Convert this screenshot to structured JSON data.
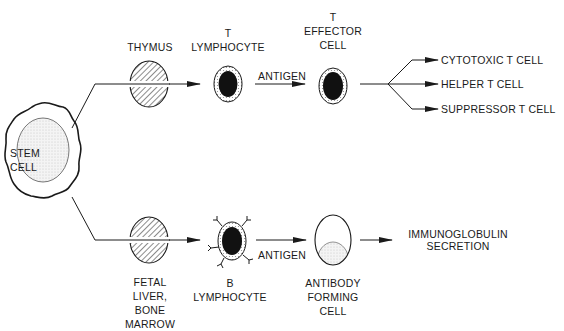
{
  "diagram": {
    "type": "flow",
    "colors": {
      "ink": "#1a1a1a",
      "background": "#ffffff",
      "stipple": "#d9d9d9"
    },
    "nodes": {
      "stem_cell": {
        "line1": "STEM",
        "line2": "CELL"
      },
      "thymus": {
        "label": "THYMUS"
      },
      "t_lymphocyte": {
        "line1": "T",
        "line2": "LYMPHOCYTE"
      },
      "t_effector": {
        "line1": "T",
        "line2": "EFFECTOR",
        "line3": "CELL"
      },
      "fetal_liver": {
        "line1": "FETAL",
        "line2": "LIVER,",
        "line3": "BONE",
        "line4": "MARROW"
      },
      "b_lymphocyte": {
        "line1": "B",
        "line2": "LYMPHOCYTE"
      },
      "antibody_cell": {
        "line1": "ANTIBODY",
        "line2": "FORMING",
        "line3": "CELL"
      }
    },
    "edges": {
      "antigen_upper": "ANTIGEN",
      "antigen_lower": "ANTIGEN"
    },
    "outputs": {
      "t_cells": [
        "CYTOTOXIC T CELL",
        "HELPER T CELL",
        "SUPPRESSOR T CELL"
      ],
      "immunoglobulin": {
        "line1": "IMMUNOGLOBULIN",
        "line2": "SECRETION"
      }
    }
  }
}
